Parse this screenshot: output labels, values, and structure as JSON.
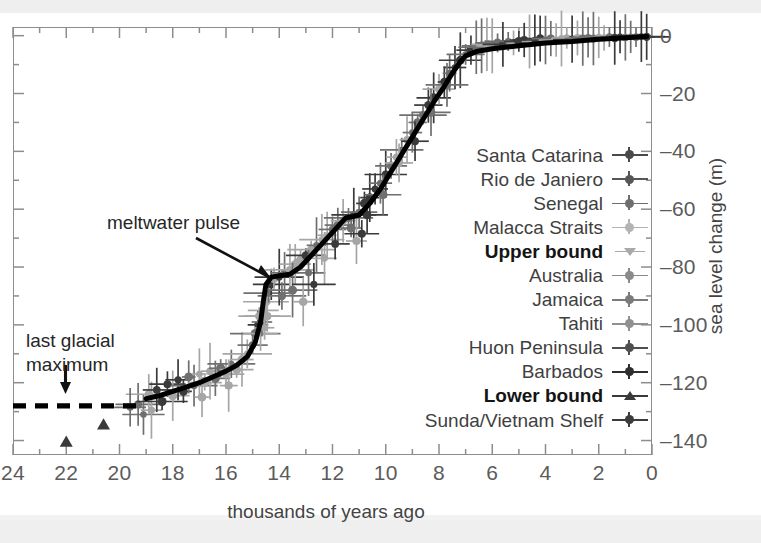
{
  "chart_data": {
    "type": "scatter",
    "title": "",
    "xlabel": "thousands of years ago",
    "ylabel": "sea level change (m)",
    "xlim": [
      24,
      0
    ],
    "ylim": [
      -145,
      3
    ],
    "x_ticks": [
      24,
      22,
      20,
      18,
      16,
      14,
      12,
      10,
      8,
      6,
      4,
      2,
      0
    ],
    "y_ticks": [
      0,
      -20,
      -40,
      -60,
      -80,
      -100,
      -120,
      -140
    ],
    "y_minor_step": 10,
    "x_minor_step": 1,
    "grid": false,
    "axis_reversed_x": true,
    "legend_position": "center-right",
    "annotations": [
      {
        "text": "meltwater pulse",
        "points_to_x": 14.6,
        "points_to_y": -83
      },
      {
        "text": "last glacial maximum",
        "points_to_x": 22.0,
        "points_to_y": -128
      }
    ],
    "series": [
      {
        "name": "Santa Catarina",
        "marker": "cross-dot",
        "color": "#4a4a4a"
      },
      {
        "name": "Rio de Janiero",
        "marker": "cross-dot",
        "color": "#565656"
      },
      {
        "name": "Senegal",
        "marker": "cross-dot",
        "color": "#6e6e6e"
      },
      {
        "name": "Malacca Straits",
        "marker": "cross-dot",
        "color": "#b4b4b4"
      },
      {
        "name": "Upper bound",
        "marker": "triangle-down",
        "color": "#a9a9a9",
        "bold": true
      },
      {
        "name": "Australia",
        "marker": "cross-dot",
        "color": "#8a8a8a"
      },
      {
        "name": "Jamaica",
        "marker": "cross-dot",
        "color": "#7b7b7b"
      },
      {
        "name": "Tahiti",
        "marker": "cross-dot",
        "color": "#909090"
      },
      {
        "name": "Huon Peninsula",
        "marker": "cross-dot",
        "color": "#4f4f4f"
      },
      {
        "name": "Barbados",
        "marker": "cross-dot",
        "color": "#2e2e2e"
      },
      {
        "name": "Lower bound",
        "marker": "triangle-up",
        "color": "#3a3a3a",
        "bold": true
      },
      {
        "name": "Sunda/Vietnam Shelf",
        "marker": "cross-dot",
        "color": "#3c3c3c"
      }
    ],
    "fit_curve": {
      "name": "best-fit sea level curve",
      "style": "solid-black",
      "points": [
        [
          19.0,
          -125.5
        ],
        [
          18.5,
          -124.5
        ],
        [
          18.0,
          -123.0
        ],
        [
          17.5,
          -121.5
        ],
        [
          17.0,
          -120.0
        ],
        [
          16.5,
          -118.0
        ],
        [
          16.0,
          -116.0
        ],
        [
          15.6,
          -114.0
        ],
        [
          15.2,
          -111.0
        ],
        [
          14.9,
          -106.0
        ],
        [
          14.7,
          -99.0
        ],
        [
          14.6,
          -92.0
        ],
        [
          14.5,
          -86.0
        ],
        [
          14.3,
          -83.5
        ],
        [
          14.0,
          -83.0
        ],
        [
          13.6,
          -82.5
        ],
        [
          13.2,
          -80.0
        ],
        [
          12.8,
          -76.0
        ],
        [
          12.4,
          -72.0
        ],
        [
          12.0,
          -68.0
        ],
        [
          11.7,
          -65.0
        ],
        [
          11.5,
          -63.0
        ],
        [
          11.2,
          -62.5
        ],
        [
          11.0,
          -62.0
        ],
        [
          10.6,
          -58.0
        ],
        [
          10.2,
          -53.0
        ],
        [
          9.8,
          -47.0
        ],
        [
          9.4,
          -41.0
        ],
        [
          9.0,
          -35.0
        ],
        [
          8.6,
          -29.0
        ],
        [
          8.2,
          -23.0
        ],
        [
          7.8,
          -17.5
        ],
        [
          7.5,
          -13.0
        ],
        [
          7.2,
          -9.0
        ],
        [
          7.0,
          -7.0
        ],
        [
          6.6,
          -5.5
        ],
        [
          6.0,
          -4.5
        ],
        [
          5.0,
          -3.5
        ],
        [
          4.0,
          -2.5
        ],
        [
          3.0,
          -2.0
        ],
        [
          2.0,
          -1.2
        ],
        [
          1.0,
          -0.7
        ],
        [
          0.2,
          -0.3
        ]
      ]
    },
    "lgm_dashed_segment": {
      "style": "dashed-black",
      "y": -128,
      "x_from": 24.0,
      "x_to": 19.2
    },
    "lower_bound_points": [
      [
        22.0,
        -140.5
      ],
      [
        20.6,
        -134.5
      ]
    ],
    "data_points": [
      [
        19.3,
        -127.5
      ],
      [
        19.1,
        -131.0
      ],
      [
        18.9,
        -124.0
      ],
      [
        18.8,
        -129.5
      ],
      [
        18.6,
        -122.5
      ],
      [
        18.4,
        -126.5
      ],
      [
        18.2,
        -120.5
      ],
      [
        18.0,
        -124.5
      ],
      [
        17.8,
        -119.0
      ],
      [
        17.6,
        -123.0
      ],
      [
        17.4,
        -118.0
      ],
      [
        17.2,
        -121.0
      ],
      [
        17.0,
        -117.0
      ],
      [
        16.8,
        -120.0
      ],
      [
        16.6,
        -116.0
      ],
      [
        16.4,
        -118.5
      ],
      [
        16.2,
        -115.0
      ],
      [
        16.0,
        -117.0
      ],
      [
        15.8,
        -113.5
      ],
      [
        15.6,
        -115.5
      ],
      [
        15.4,
        -112.0
      ],
      [
        15.2,
        -110.0
      ],
      [
        15.0,
        -107.0
      ],
      [
        14.9,
        -103.0
      ],
      [
        14.8,
        -100.0
      ],
      [
        14.75,
        -97.0
      ],
      [
        14.7,
        -103.0
      ],
      [
        14.65,
        -99.0
      ],
      [
        14.6,
        -95.0
      ],
      [
        14.55,
        -101.0
      ],
      [
        14.5,
        -92.0
      ],
      [
        14.45,
        -97.0
      ],
      [
        14.4,
        -89.0
      ],
      [
        14.3,
        -86.0
      ],
      [
        14.2,
        -84.0
      ],
      [
        14.0,
        -83.5
      ],
      [
        13.8,
        -82.0
      ],
      [
        13.6,
        -81.0
      ],
      [
        13.4,
        -79.0
      ],
      [
        13.2,
        -77.5
      ],
      [
        13.0,
        -76.0
      ],
      [
        12.8,
        -74.0
      ],
      [
        12.6,
        -72.5
      ],
      [
        12.4,
        -70.5
      ],
      [
        12.2,
        -69.0
      ],
      [
        12.0,
        -67.0
      ],
      [
        11.8,
        -65.5
      ],
      [
        11.6,
        -64.0
      ],
      [
        11.4,
        -63.0
      ],
      [
        11.2,
        -62.0
      ],
      [
        11.0,
        -61.0
      ],
      [
        10.8,
        -58.0
      ],
      [
        10.6,
        -56.0
      ],
      [
        10.4,
        -53.0
      ],
      [
        10.2,
        -51.0
      ],
      [
        10.0,
        -48.0
      ],
      [
        9.8,
        -45.0
      ],
      [
        9.6,
        -42.0
      ],
      [
        9.4,
        -39.5
      ],
      [
        9.2,
        -36.0
      ],
      [
        9.0,
        -33.5
      ],
      [
        8.8,
        -30.0
      ],
      [
        8.6,
        -27.5
      ],
      [
        8.4,
        -24.0
      ],
      [
        8.2,
        -21.5
      ],
      [
        8.0,
        -18.5
      ],
      [
        7.8,
        -16.0
      ],
      [
        7.6,
        -13.0
      ],
      [
        7.4,
        -11.0
      ],
      [
        7.2,
        -8.5
      ],
      [
        7.0,
        -6.5
      ],
      [
        6.8,
        -5.0
      ],
      [
        6.6,
        -4.0
      ],
      [
        6.4,
        -3.5
      ],
      [
        6.2,
        -3.0
      ],
      [
        6.0,
        -3.5
      ],
      [
        5.8,
        -2.5
      ],
      [
        5.6,
        -3.0
      ],
      [
        5.4,
        -2.0
      ],
      [
        5.2,
        -2.5
      ],
      [
        5.0,
        -2.0
      ],
      [
        4.8,
        -1.5
      ],
      [
        4.6,
        -2.0
      ],
      [
        4.4,
        -1.5
      ],
      [
        4.2,
        -1.0
      ],
      [
        4.0,
        -1.5
      ],
      [
        3.8,
        -1.0
      ],
      [
        3.6,
        -1.5
      ],
      [
        3.4,
        -1.0
      ],
      [
        3.2,
        -0.8
      ],
      [
        3.0,
        -1.2
      ],
      [
        2.8,
        -0.8
      ],
      [
        2.6,
        -1.0
      ],
      [
        2.4,
        -0.6
      ],
      [
        2.2,
        -1.0
      ],
      [
        2.0,
        -0.6
      ],
      [
        1.8,
        -0.8
      ],
      [
        1.6,
        -0.5
      ],
      [
        1.4,
        -0.8
      ],
      [
        1.2,
        -0.4
      ],
      [
        1.0,
        -0.6
      ],
      [
        0.8,
        -0.4
      ],
      [
        0.6,
        -0.5
      ],
      [
        0.4,
        -0.3
      ],
      [
        0.2,
        -0.4
      ],
      [
        13.9,
        -90.0
      ],
      [
        13.5,
        -88.0
      ],
      [
        12.9,
        -82.0
      ],
      [
        12.3,
        -77.0
      ],
      [
        11.9,
        -72.0
      ],
      [
        11.3,
        -66.5
      ],
      [
        10.7,
        -62.0
      ],
      [
        10.1,
        -55.0
      ],
      [
        9.5,
        -44.0
      ],
      [
        8.9,
        -36.5
      ],
      [
        8.3,
        -26.5
      ],
      [
        7.7,
        -17.0
      ],
      [
        16.9,
        -125.0
      ],
      [
        15.9,
        -121.0
      ],
      [
        19.6,
        -128.5
      ],
      [
        13.1,
        -92.0
      ],
      [
        12.7,
        -86.0
      ],
      [
        11.1,
        -71.0
      ],
      [
        10.9,
        -68.5
      ]
    ]
  },
  "axis": {
    "x_tick_labels": [
      "24",
      "22",
      "20",
      "18",
      "16",
      "14",
      "12",
      "10",
      "8",
      "6",
      "4",
      "2",
      "0"
    ],
    "y_tick_labels": [
      "0",
      "–20",
      "–40",
      "–60",
      "–80",
      "–100",
      "–120",
      "–140"
    ],
    "x_title": "thousands of years ago",
    "y_title": "sea level change (m)"
  },
  "annotations": {
    "meltwater": "meltwater pulse",
    "lgm_line1": "last glacial",
    "lgm_line2": "maximum"
  },
  "legend": {
    "items": [
      {
        "label": "Santa Catarina",
        "bold": false,
        "marker": "cross-dot",
        "color": "#4a4a4a"
      },
      {
        "label": "Rio de Janiero",
        "bold": false,
        "marker": "cross-dot",
        "color": "#565656"
      },
      {
        "label": "Senegal",
        "bold": false,
        "marker": "cross-dot",
        "color": "#6e6e6e"
      },
      {
        "label": "Malacca Straits",
        "bold": false,
        "marker": "cross-dot",
        "color": "#b4b4b4"
      },
      {
        "label": "Upper bound",
        "bold": true,
        "marker": "triangle-down",
        "color": "#a9a9a9"
      },
      {
        "label": "Australia",
        "bold": false,
        "marker": "cross-dot",
        "color": "#8a8a8a"
      },
      {
        "label": "Jamaica",
        "bold": false,
        "marker": "cross-dot",
        "color": "#7b7b7b"
      },
      {
        "label": "Tahiti",
        "bold": false,
        "marker": "cross-dot",
        "color": "#909090"
      },
      {
        "label": "Huon Peninsula",
        "bold": false,
        "marker": "cross-dot",
        "color": "#4f4f4f"
      },
      {
        "label": "Barbados",
        "bold": false,
        "marker": "cross-dot",
        "color": "#2e2e2e"
      },
      {
        "label": "Lower bound",
        "bold": true,
        "marker": "triangle-up",
        "color": "#3a3a3a"
      },
      {
        "label": "Sunda/Vietnam Shelf",
        "bold": false,
        "marker": "cross-dot",
        "color": "#3c3c3c"
      }
    ]
  },
  "colors": {
    "frame": "#8d8d8d",
    "curve": "#000000",
    "text": "#3f3f3f",
    "tick_text": "#5b5b5b",
    "background": "#ffffff"
  }
}
